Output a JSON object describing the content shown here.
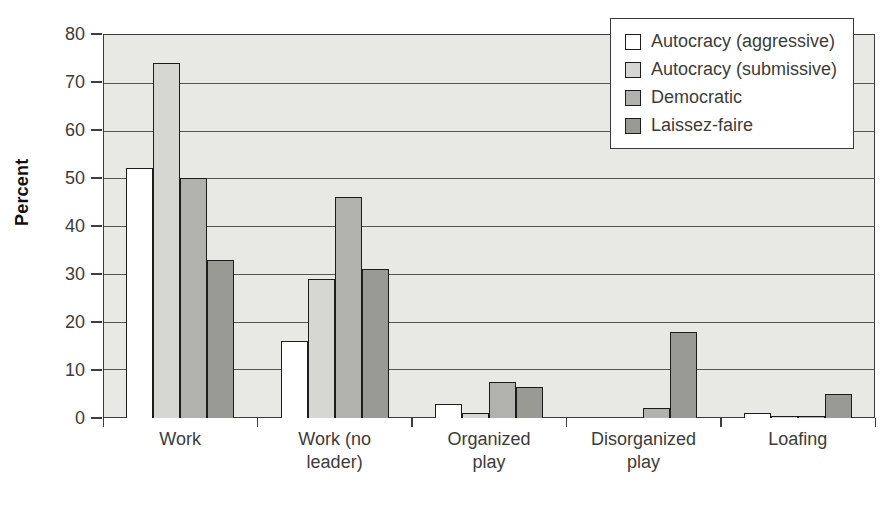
{
  "chart_data": {
    "type": "bar",
    "title": "",
    "ylabel": "Percent",
    "xlabel": "",
    "ylim": [
      0,
      80
    ],
    "y_tick_step": 10,
    "y_ticks": [
      0,
      10,
      20,
      30,
      40,
      50,
      60,
      70,
      80
    ],
    "grid": true,
    "legend_position": "top-right-inside",
    "categories": [
      "Work",
      "Work (no leader)",
      "Organized play",
      "Disorganized play",
      "Loafing"
    ],
    "series": [
      {
        "name": "Autocracy (aggressive)",
        "color": "#ffffff",
        "values": [
          52,
          16,
          3,
          0,
          1
        ]
      },
      {
        "name": "Autocracy (submissive)",
        "color": "#d6d6d2",
        "values": [
          74,
          29,
          1,
          0,
          0.5
        ]
      },
      {
        "name": "Democratic",
        "color": "#b1b1ad",
        "values": [
          50,
          46,
          7.5,
          2,
          0.5
        ]
      },
      {
        "name": "Laissez-faire",
        "color": "#9a9a95",
        "values": [
          33,
          31,
          6.5,
          18,
          5
        ]
      }
    ],
    "colors": {
      "plot_background": "#e8e8e5",
      "gridline": "#55554f",
      "frame": "#3d3d3b",
      "bar_outline": "#1c1c1a",
      "tick_label": "#3c3c3a"
    }
  }
}
